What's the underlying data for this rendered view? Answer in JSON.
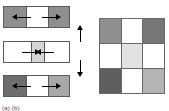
{
  "figure": {
    "background_color": "#ffffff",
    "border_color": "#5a5a5a",
    "arrow_color": "#000000"
  },
  "panels": [
    {
      "id": "panel-top",
      "name": "expanded-domain-panel",
      "x": 3,
      "y": 6,
      "width": 67,
      "height": 22,
      "bands": [
        {
          "name": "left-region",
          "left": 0,
          "width": 23,
          "color": "#8f8f8f",
          "edge": "edge-left"
        },
        {
          "name": "center-region",
          "left": 23,
          "width": 21,
          "color": "#ffffff",
          "edge": "none"
        },
        {
          "name": "right-region",
          "left": 44,
          "width": 23,
          "color": "#8f8f8f",
          "edge": "edge-right"
        }
      ],
      "arrows": [
        {
          "name": "left-outward-arrow",
          "direction": "left",
          "x": 14,
          "y": 11,
          "length": 14
        },
        {
          "name": "right-outward-arrow",
          "direction": "right",
          "x": 39,
          "y": 11,
          "length": 14
        }
      ]
    },
    {
      "id": "panel-middle",
      "name": "contracted-domain-panel",
      "x": 3,
      "y": 41,
      "width": 67,
      "height": 22,
      "bands": [
        {
          "name": "left-region",
          "left": 0,
          "width": 27,
          "color": "#ffffff",
          "edge": "none"
        },
        {
          "name": "center-region",
          "left": 27,
          "width": 14,
          "color": "#d6d6d6",
          "edge": "mid"
        },
        {
          "name": "right-region",
          "left": 41,
          "width": 26,
          "color": "#ffffff",
          "edge": "none"
        }
      ],
      "arrows": [
        {
          "name": "left-inward-arrow",
          "direction": "right",
          "x": 19,
          "y": 11,
          "length": 13
        },
        {
          "name": "right-inward-arrow",
          "direction": "left",
          "x": 38,
          "y": 11,
          "length": 13
        }
      ]
    },
    {
      "id": "panel-bottom",
      "name": "asymmetric-domain-panel",
      "x": 3,
      "y": 75,
      "width": 67,
      "height": 22,
      "bands": [
        {
          "name": "left-region",
          "left": 0,
          "width": 23,
          "color": "#6e6e6e",
          "edge": "edge-left"
        },
        {
          "name": "center-region",
          "left": 23,
          "width": 21,
          "color": "#ffffff",
          "edge": "none"
        },
        {
          "name": "right-region",
          "left": 44,
          "width": 23,
          "color": "#a8a8a8",
          "edge": "edge-right"
        }
      ],
      "arrows": [
        {
          "name": "left-outward-arrow",
          "direction": "left",
          "x": 14,
          "y": 11,
          "length": 14
        },
        {
          "name": "right-outward-arrow",
          "direction": "right",
          "x": 39,
          "y": 11,
          "length": 14
        }
      ]
    }
  ],
  "connector_arrows": [
    {
      "name": "upward-transition-arrow",
      "direction": "up",
      "x": 80,
      "y": 30,
      "length": 12
    },
    {
      "name": "downward-transition-arrow",
      "direction": "down",
      "x": 80,
      "y": 60,
      "length": 12
    }
  ],
  "grid": {
    "name": "domain-pattern-grid",
    "x": 99,
    "y": 18,
    "width": 66,
    "height": 76,
    "rows": 3,
    "columns": 3,
    "border_color": "#6a6a6a",
    "cells": [
      {
        "name": "cell-r1c1",
        "row": 1,
        "col": 1,
        "color": "#8f8f8f",
        "shade": "medium-gray"
      },
      {
        "name": "cell-r1c2",
        "row": 1,
        "col": 2,
        "color": "#ffffff",
        "shade": "white"
      },
      {
        "name": "cell-r1c3",
        "row": 1,
        "col": 3,
        "color": "#767676",
        "shade": "dark-gray"
      },
      {
        "name": "cell-r2c1",
        "row": 2,
        "col": 1,
        "color": "#ffffff",
        "shade": "white"
      },
      {
        "name": "cell-r2c2",
        "row": 2,
        "col": 2,
        "color": "#e2e2e2",
        "shade": "very-light-gray"
      },
      {
        "name": "cell-r2c3",
        "row": 2,
        "col": 3,
        "color": "#ffffff",
        "shade": "white"
      },
      {
        "name": "cell-r3c1",
        "row": 3,
        "col": 1,
        "color": "#5f5f5f",
        "shade": "darkest-gray"
      },
      {
        "name": "cell-r3c2",
        "row": 3,
        "col": 2,
        "color": "#ffffff",
        "shade": "white"
      },
      {
        "name": "cell-r3c3",
        "row": 3,
        "col": 3,
        "color": "#b4b4b4",
        "shade": "light-gray"
      }
    ]
  },
  "caption": {
    "text": "(a)  (b)",
    "note": "clipped at image bottom edge"
  }
}
